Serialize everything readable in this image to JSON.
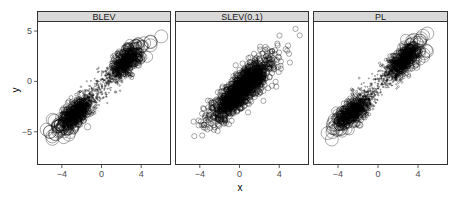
{
  "chart_data": {
    "type": "scatter",
    "layout": "facet_wrap 1x3",
    "xlabel": "x",
    "ylabel": "y",
    "xlim": [
      -6.5,
      7.0
    ],
    "ylim": [
      -8.3,
      6.0
    ],
    "xticks": [
      -4,
      0,
      4
    ],
    "yticks": [
      -5,
      0,
      5
    ],
    "grid": false,
    "panels": [
      {
        "title": "BLEV",
        "description": "Bivariate points along y≈x line; two dense clusters near (-2,-2.5) and (2,1.5); circle size grows with leverage (distance from center); smallest dots near center",
        "size_mode": "leverage",
        "clusters": [
          {
            "cx": -2.0,
            "cy": -2.5
          },
          {
            "cx": 2.0,
            "cy": 1.5
          }
        ],
        "x_range_observed": [
          -5.8,
          6.3
        ],
        "y_range_observed": [
          -7.8,
          5.3
        ]
      },
      {
        "title": "SLEV(0.1)",
        "description": "Single elongated cloud along y≈x; mostly uniform medium-sized circles",
        "size_mode": "uniform",
        "clusters": [
          {
            "cx": 0.0,
            "cy": -0.5
          }
        ],
        "x_range_observed": [
          -5.8,
          6.3
        ],
        "y_range_observed": [
          -7.8,
          5.3
        ]
      },
      {
        "title": "PL",
        "description": "Similar to BLEV; two dense clusters along y≈x; circle size grows with distance from center",
        "size_mode": "leverage",
        "clusters": [
          {
            "cx": -2.0,
            "cy": -2.5
          },
          {
            "cx": 2.0,
            "cy": 1.5
          }
        ],
        "x_range_observed": [
          -5.8,
          6.3
        ],
        "y_range_observed": [
          -7.8,
          5.3
        ]
      }
    ],
    "point_style": {
      "shape": "open circle",
      "stroke": "#000000",
      "fill": "none"
    },
    "strip_fill": "#d9d9d9",
    "panel_border": "#333333"
  }
}
